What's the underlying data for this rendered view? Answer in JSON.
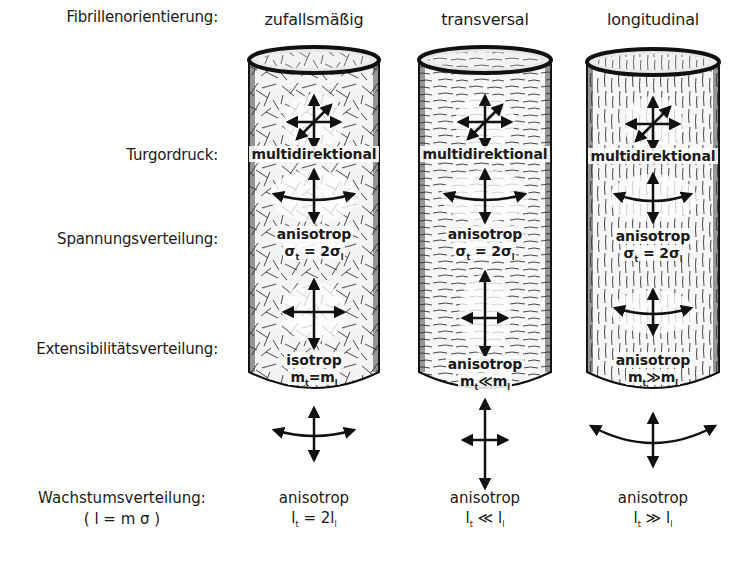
{
  "figure": {
    "row_labels": {
      "fibril_orientation": "Fibrillenorientierung:",
      "turgor": "Turgordruck:",
      "stress": "Spannungsverteilung:",
      "extensibility": "Extensibilitätsverteilung:",
      "growth": "Wachstumsverteilung:",
      "growth_formula": "( l = m σ )"
    },
    "columns": [
      {
        "orientation": "zufallsmäßig",
        "texture": "random",
        "turgor": "multidirektional",
        "stress_type": "anisotrop",
        "stress_formula": {
          "lhs": "σ",
          "lhs_sub": "t",
          "op": " = 2",
          "rhs": "σ",
          "rhs_sub": "l"
        },
        "extensibility_type": "isotrop",
        "extensibility_formula": {
          "lhs": "m",
          "lhs_sub": "t",
          "op": "=",
          "rhs": "m",
          "rhs_sub": "l"
        },
        "growth_type": "anisotrop",
        "growth_formula": {
          "lhs": "l",
          "lhs_sub": "t",
          "op": " = 2",
          "rhs": "l",
          "rhs_sub": "l"
        }
      },
      {
        "orientation": "transversal",
        "texture": "horizontal",
        "turgor": "multidirektional",
        "stress_type": "anisotrop",
        "stress_formula": {
          "lhs": "σ",
          "lhs_sub": "t",
          "op": " = 2",
          "rhs": "σ",
          "rhs_sub": "l"
        },
        "extensibility_type": "anisotrop",
        "extensibility_formula": {
          "lhs": "m",
          "lhs_sub": "t",
          "op": "≪",
          "rhs": "m",
          "rhs_sub": "l"
        },
        "growth_type": "anisotrop",
        "growth_formula": {
          "lhs": "l",
          "lhs_sub": "t",
          "op": " ≪ ",
          "rhs": "l",
          "rhs_sub": "l"
        }
      },
      {
        "orientation": "longitudinal",
        "texture": "vertical",
        "turgor": "multidirektional",
        "stress_type": "anisotrop",
        "stress_formula": {
          "lhs": "σ",
          "lhs_sub": "t",
          "op": " = 2",
          "rhs": "σ",
          "rhs_sub": "l"
        },
        "extensibility_type": "anisotrop",
        "extensibility_formula": {
          "lhs": "m",
          "lhs_sub": "t",
          "op": "≫",
          "rhs": "m",
          "rhs_sub": "l"
        },
        "growth_type": "anisotrop",
        "growth_formula": {
          "lhs": "l",
          "lhs_sub": "t",
          "op": " ≫ ",
          "rhs": "l",
          "rhs_sub": "l"
        }
      }
    ],
    "colors": {
      "ink": "#1a1a1a",
      "background": "#ffffff"
    }
  }
}
